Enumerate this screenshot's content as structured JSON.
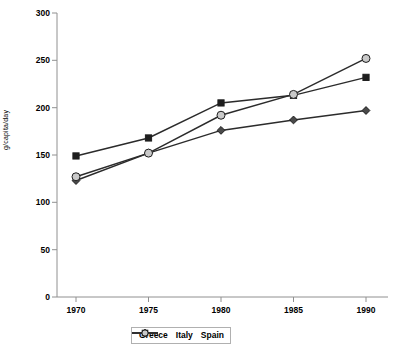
{
  "chart_data": {
    "type": "line",
    "title": "",
    "xlabel": "",
    "ylabel": "g/capita/day",
    "categories": [
      "1970",
      "1975",
      "1980",
      "1985",
      "1990"
    ],
    "x": [
      1970,
      1975,
      1980,
      1985,
      1990
    ],
    "xlim": [
      1968,
      1992
    ],
    "ylim": [
      0,
      300
    ],
    "yticks": [
      0,
      50,
      100,
      150,
      200,
      250,
      300
    ],
    "ytick_labels": [
      "0",
      "50",
      "100",
      "150",
      "200",
      "250",
      "300"
    ],
    "grid": false,
    "legend_position": "bottom-center",
    "series": [
      {
        "name": "Greece",
        "marker": "diamond",
        "marker_fill": "#4a4a4a",
        "color": "#2b2b2b",
        "values": [
          123,
          152,
          176,
          187,
          197
        ]
      },
      {
        "name": "Italy",
        "marker": "square",
        "marker_fill": "#1e1e1e",
        "color": "#2b2b2b",
        "values": [
          149,
          168,
          205,
          213,
          232
        ]
      },
      {
        "name": "Spain",
        "marker": "circle",
        "marker_fill": "#c9c9c9",
        "color": "#2b2b2b",
        "values": [
          127,
          152,
          192,
          214,
          252
        ]
      }
    ]
  },
  "axis": {
    "line_color": "#808080",
    "tick_color": "#808080"
  }
}
